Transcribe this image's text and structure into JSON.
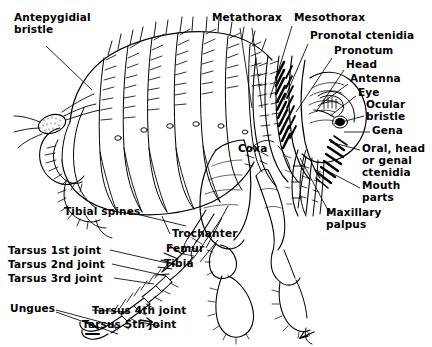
{
  "figure": {
    "style": "black-and-white line drawing",
    "background_color": "#ffffff",
    "ink_color": "#000000"
  },
  "labels": [
    {
      "id": "antepygidial-bristle",
      "text": "Antepygidial\nbristle",
      "x": 14,
      "y": 12
    },
    {
      "id": "metathorax",
      "text": "Metathorax",
      "x": 212,
      "y": 12
    },
    {
      "id": "mesothorax",
      "text": "Mesothorax",
      "x": 294,
      "y": 12
    },
    {
      "id": "pronotal-ctenidia",
      "text": "Pronotal ctenidia",
      "x": 310,
      "y": 30
    },
    {
      "id": "pronotum",
      "text": "Pronotum",
      "x": 334,
      "y": 45
    },
    {
      "id": "head",
      "text": "Head",
      "x": 346,
      "y": 59
    },
    {
      "id": "antenna",
      "text": "Antenna",
      "x": 350,
      "y": 73
    },
    {
      "id": "eye",
      "text": "Eye",
      "x": 358,
      "y": 87
    },
    {
      "id": "ocular-bristle",
      "text": "Ocular\nbristle",
      "x": 366,
      "y": 99
    },
    {
      "id": "gena",
      "text": "Gena",
      "x": 372,
      "y": 125
    },
    {
      "id": "oral-head-or-genal-ctenidia",
      "text": "Oral, head\nor genal\nctenidia",
      "x": 362,
      "y": 143
    },
    {
      "id": "mouth-parts",
      "text": "Mouth\nparts",
      "x": 362,
      "y": 180
    },
    {
      "id": "maxillary-palpus",
      "text": "Maxillary\npalpus",
      "x": 326,
      "y": 207
    },
    {
      "id": "coxa",
      "text": "Coxa",
      "x": 238,
      "y": 143
    },
    {
      "id": "tibial-spines",
      "text": "Tibial spines",
      "x": 64,
      "y": 206
    },
    {
      "id": "trochanter",
      "text": "Trochanter",
      "x": 172,
      "y": 228
    },
    {
      "id": "femur",
      "text": "Femur",
      "x": 166,
      "y": 243
    },
    {
      "id": "tibia",
      "text": "Tibia",
      "x": 164,
      "y": 258
    },
    {
      "id": "tarsus-1st-joint",
      "text": "Tarsus 1st joint",
      "x": 8,
      "y": 245
    },
    {
      "id": "tarsus-2nd-joint",
      "text": "Tarsus 2nd joint",
      "x": 8,
      "y": 259
    },
    {
      "id": "tarsus-3rd-joint",
      "text": "Tarsus 3rd joint",
      "x": 8,
      "y": 273
    },
    {
      "id": "ungues",
      "text": "Ungues",
      "x": 10,
      "y": 303
    },
    {
      "id": "tarsus-4th-joint",
      "text": "Tarsus 4th joint",
      "x": 92,
      "y": 305
    },
    {
      "id": "tarsus-5th-joint",
      "text": "Tarsus 5th joint",
      "x": 82,
      "y": 319
    }
  ],
  "leader_lines": [
    {
      "id": "leader-antepygidial-bristle",
      "from": [
        46,
        46
      ],
      "to": [
        92,
        90
      ]
    },
    {
      "id": "leader-metathorax",
      "from": [
        240,
        28
      ],
      "to": [
        252,
        108
      ]
    },
    {
      "id": "leader-metathorax-b",
      "from": [
        252,
        28
      ],
      "to": [
        262,
        108
      ]
    },
    {
      "id": "leader-mesothorax",
      "from": [
        292,
        26
      ],
      "to": [
        270,
        98
      ]
    },
    {
      "id": "leader-pronotal-ctenidia",
      "from": [
        308,
        44
      ],
      "to": [
        284,
        100
      ]
    },
    {
      "id": "leader-pronotum",
      "from": [
        332,
        58
      ],
      "to": [
        296,
        112
      ]
    },
    {
      "id": "leader-head",
      "from": [
        344,
        70
      ],
      "to": [
        316,
        112
      ]
    },
    {
      "id": "leader-antenna",
      "from": [
        348,
        84
      ],
      "to": [
        318,
        106
      ]
    },
    {
      "id": "leader-eye",
      "from": [
        356,
        96
      ],
      "to": [
        330,
        116
      ]
    },
    {
      "id": "leader-ocular-bristle",
      "from": [
        364,
        116
      ],
      "to": [
        334,
        124
      ]
    },
    {
      "id": "leader-gena",
      "from": [
        370,
        132
      ],
      "to": [
        344,
        132
      ]
    },
    {
      "id": "leader-oral-ctenidia",
      "from": [
        360,
        150
      ],
      "to": [
        330,
        142
      ]
    },
    {
      "id": "leader-mouth-parts",
      "from": [
        360,
        188
      ],
      "to": [
        322,
        168
      ]
    },
    {
      "id": "leader-maxillary-palpus",
      "from": [
        330,
        214
      ],
      "to": [
        300,
        158
      ]
    },
    {
      "id": "leader-tibial-spines",
      "from": [
        128,
        212
      ],
      "to": [
        186,
        226
      ]
    },
    {
      "id": "leader-trochanter",
      "from": [
        170,
        234
      ],
      "to": [
        162,
        216
      ]
    },
    {
      "id": "leader-femur",
      "from": [
        206,
        248
      ],
      "to": [
        222,
        218
      ]
    },
    {
      "id": "leader-tibia",
      "from": [
        200,
        262
      ],
      "to": [
        218,
        240
      ]
    },
    {
      "id": "leader-tarsus-1",
      "from": [
        110,
        250
      ],
      "to": [
        180,
        266
      ]
    },
    {
      "id": "leader-tarsus-2",
      "from": [
        112,
        264
      ],
      "to": [
        166,
        276
      ]
    },
    {
      "id": "leader-tarsus-3",
      "from": [
        114,
        278
      ],
      "to": [
        154,
        284
      ]
    },
    {
      "id": "leader-ungues-a",
      "from": [
        56,
        310
      ],
      "to": [
        116,
        326
      ]
    },
    {
      "id": "leader-ungues-b",
      "from": [
        56,
        312
      ],
      "to": [
        118,
        334
      ]
    },
    {
      "id": "leader-tarsus-4",
      "from": [
        92,
        310
      ],
      "to": [
        128,
        312
      ]
    },
    {
      "id": "leader-tarsus-5",
      "from": [
        160,
        326
      ],
      "to": [
        140,
        322
      ]
    }
  ]
}
